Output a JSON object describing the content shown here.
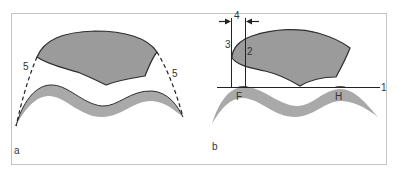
{
  "figure": {
    "panels": [
      {
        "id": "a",
        "label": "a",
        "callouts": [
          {
            "id": "5-left",
            "text": "5"
          },
          {
            "id": "5-right",
            "text": "5"
          }
        ]
      },
      {
        "id": "b",
        "label": "b",
        "callouts": [
          {
            "id": "1",
            "text": "1"
          },
          {
            "id": "2",
            "text": "2"
          },
          {
            "id": "3",
            "text": "3"
          },
          {
            "id": "4",
            "text": "4"
          },
          {
            "id": "F",
            "text": "F"
          },
          {
            "id": "H",
            "text": "H"
          }
        ]
      }
    ],
    "colors": {
      "frame": "#bdbdbd",
      "upper_fill": "#9b9b9b",
      "band_fill": "#a9a9a9",
      "outline": "#333333",
      "line": "#222222"
    }
  }
}
